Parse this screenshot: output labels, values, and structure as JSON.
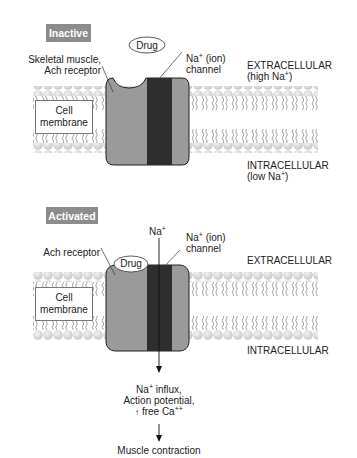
{
  "panels": [
    {
      "state_label": "Inactive",
      "drug_label": "Drug",
      "receptor_label_line1": "Skeletal muscle,",
      "receptor_label_line2": "Ach receptor",
      "channel_label_line1": "Na",
      "channel_label_sup": "+",
      "channel_label_line1_rest": " (ion)",
      "channel_label_line2": "channel",
      "extracellular_label": "EXTRACELLULAR",
      "extracellular_sub_pre": "(high Na",
      "extracellular_sub_sup": "+",
      "extracellular_sub_post": ")",
      "intracellular_label": "INTRACELLULAR",
      "intracellular_sub_pre": "(low Na",
      "intracellular_sub_sup": "+",
      "intracellular_sub_post": ")",
      "membrane_label_line1": "Cell",
      "membrane_label_line2": "membrane"
    },
    {
      "state_label": "Activated",
      "drug_label": "Drug",
      "receptor_label": "Ach receptor",
      "ion_label": "Na",
      "ion_sup": "+",
      "channel_label_line1": "Na",
      "channel_label_sup": "+",
      "channel_label_line1_rest": " (ion)",
      "channel_label_line2": "channel",
      "extracellular_label": "EXTRACELLULAR",
      "intracellular_label": "INTRACELLULAR",
      "membrane_label_line1": "Cell",
      "membrane_label_line2": "membrane",
      "effect_line1_pre": "Na",
      "effect_line1_sup": "+",
      "effect_line1_post": " influx,",
      "effect_line2": "Action potential,",
      "effect_line3_arrow": "↑",
      "effect_line3_pre": " free Ca",
      "effect_line3_sup": "++",
      "outcome": "Muscle contraction"
    }
  ],
  "colors": {
    "tag_bg": "#8c8c8c",
    "receptor_fill": "#9a9a9a",
    "channel_fill": "#2e2e2e",
    "lipid_head": "#d9d9d9"
  }
}
